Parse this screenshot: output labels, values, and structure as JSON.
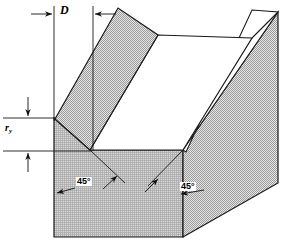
{
  "figure": {
    "type": "engineering-line-drawing",
    "labels": {
      "width_symbol": "D",
      "depth_symbol": "r",
      "depth_subscript": "y",
      "angle_left": "45°",
      "angle_right": "45°"
    },
    "colors": {
      "line": "#1a1a1a",
      "wall_fill": "#b9b9b9",
      "section_fill": "#c9c9c9",
      "floor_fill": "#ffffff",
      "background": "#ffffff"
    },
    "dimensions": {
      "D_extension_left_x": 54,
      "D_extension_right_x": 93,
      "ry_top_y": 118,
      "ry_bottom_y": 151
    }
  }
}
